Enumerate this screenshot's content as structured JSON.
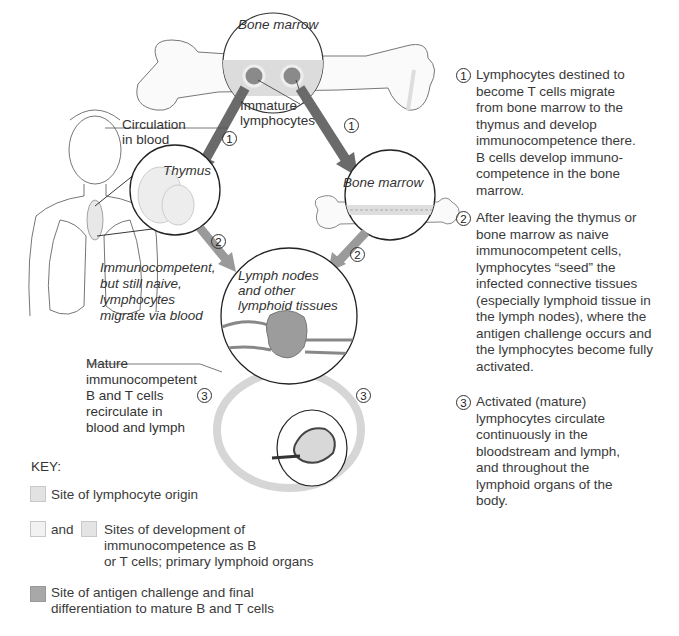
{
  "diagram": {
    "labels": {
      "bone_marrow_top": "Bone marrow",
      "immature_lymphocytes": "Immature\nlymphocytes",
      "circulation_in_blood": "Circulation\nin blood",
      "thymus": "Thymus",
      "bone_marrow_right": "Bone marrow",
      "immunocompetent_naive": "Immunocompetent,\nbut still naive,\nlymphocytes\nmigrate via blood",
      "lymph_nodes": "Lymph nodes\nand other\nlymphoid tissues",
      "mature_recirculate": "Mature\nimmunocompetent\nB and T cells\nrecirculate in\nblood and lymph"
    },
    "step_markers": [
      "1",
      "1",
      "2",
      "2",
      "3",
      "3"
    ]
  },
  "notes": [
    {
      "number": "1",
      "text": "Lymphocytes destined to\nbecome T cells migrate\nfrom bone marrow to the\nthymus and develop\nimmunocompetence there.\nB cells develop immuno-\ncompetence in the bone\nmarrow."
    },
    {
      "number": "2",
      "text": "After leaving the thymus or\nbone marrow as naive\nimmunocompetent cells,\nlymphocytes “seed” the\ninfected connective tissues\n(especially lymphoid tissue in\nthe lymph nodes), where the\nantigen challenge occurs and\nthe lymphocytes become fully\nactivated."
    },
    {
      "number": "3",
      "text": "Activated (mature)\nlymphocytes circulate\ncontinuously in the\nbloodstream and lymph,\nand throughout the\nlymphoid organs of the\nbody."
    }
  ],
  "key": {
    "title": "KEY:",
    "items": [
      {
        "text": "Site of lymphocyte origin",
        "color": "#e2e2e2"
      },
      {
        "joiner": "and",
        "text": "Sites of development of\n immunocompetence as B\n or T cells; primary lymphoid organs",
        "colors": [
          "#f2f2f2",
          "#e4e4e4"
        ]
      },
      {
        "text": "Site of antigen challenge and final\ndifferentiation to mature B and T cells",
        "color": "#a8a8a8"
      }
    ]
  },
  "colors": {
    "dark_arrow": "#6a6a6a",
    "medium_arrow": "#9a9a9a",
    "light_cycle": "#d6d6d6",
    "marrow_fill": "#dcdcdc",
    "node_fill": "#9c9c9c"
  }
}
